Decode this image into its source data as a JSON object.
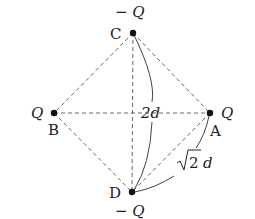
{
  "points": {
    "A": {
      "label": "A",
      "charge": "Q",
      "x": 210,
      "y": 113
    },
    "B": {
      "label": "B",
      "charge": "Q",
      "x": 54,
      "y": 113
    },
    "C": {
      "label": "C",
      "charge": "− Q",
      "x": 133,
      "y": 33
    },
    "D": {
      "label": "D",
      "charge": "− Q",
      "x": 132,
      "y": 192
    }
  },
  "dimensions": {
    "CD": "2d",
    "DA_root": "2",
    "DA_unit": "d"
  },
  "colors": {
    "line": "#555555",
    "dot": "#111111",
    "text": "#222222"
  }
}
